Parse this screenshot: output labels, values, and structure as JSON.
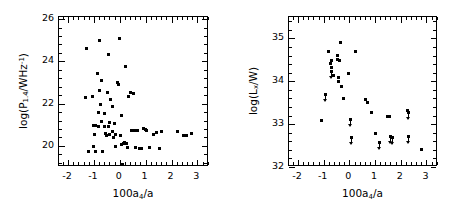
{
  "figure": {
    "background": "#ffffff",
    "marker_color": "#000000",
    "panel_count": 2
  },
  "chart_data": [
    {
      "type": "scatter",
      "panel": "left",
      "title": "",
      "xlabel": "100a4/a",
      "ylabel": "log(P1.4/WHz^-1)",
      "xlabel_parts": {
        "pre": "100a",
        "sub": "4",
        "post": "/a"
      },
      "ylabel_parts": {
        "pre": "log(P",
        "sub": "1.4",
        "mid": "/WHz",
        "sup": "-1",
        "post": ")"
      },
      "xlim": [
        -2.35,
        3.45
      ],
      "ylim": [
        19.0,
        26.1
      ],
      "xticks": [
        -2,
        -1,
        0,
        1,
        2,
        3
      ],
      "xticklabels": [
        "-2",
        "-1",
        "0",
        "1",
        "2",
        "3"
      ],
      "yticks": [
        20,
        22,
        24,
        26
      ],
      "yticklabels": [
        "20",
        "22",
        "24",
        "26"
      ],
      "xminor_step": 0.2,
      "yminor_step": 0.4,
      "grid": false,
      "legend": null,
      "points": [
        [
          -1.3,
          24.62
        ],
        [
          -1.32,
          22.3
        ],
        [
          -1.22,
          19.72
        ],
        [
          -1.05,
          22.32
        ],
        [
          -1.03,
          20.95
        ],
        [
          -1.02,
          19.97
        ],
        [
          -0.98,
          20.52
        ],
        [
          -0.95,
          20.98
        ],
        [
          -0.92,
          19.72
        ],
        [
          -0.88,
          23.42
        ],
        [
          -0.84,
          21.6
        ],
        [
          -0.82,
          20.92
        ],
        [
          -0.8,
          22.62
        ],
        [
          -0.78,
          25.0
        ],
        [
          -0.76,
          21.98
        ],
        [
          -0.72,
          23.08
        ],
        [
          -0.7,
          21.15
        ],
        [
          -0.66,
          19.73
        ],
        [
          -0.6,
          20.92
        ],
        [
          -0.58,
          21.52
        ],
        [
          -0.55,
          20.6
        ],
        [
          -0.52,
          20.48
        ],
        [
          -0.48,
          22.52
        ],
        [
          -0.45,
          24.32
        ],
        [
          -0.42,
          20.9
        ],
        [
          -0.4,
          21.12
        ],
        [
          -0.38,
          20.55
        ],
        [
          -0.35,
          22.2
        ],
        [
          -0.3,
          21.85
        ],
        [
          -0.28,
          20.7
        ],
        [
          -0.25,
          20.38
        ],
        [
          -0.22,
          21.08
        ],
        [
          -0.18,
          20.52
        ],
        [
          -0.15,
          19.98
        ],
        [
          -0.1,
          23.02
        ],
        [
          -0.05,
          22.9
        ],
        [
          0.0,
          25.1
        ],
        [
          0.02,
          20.48
        ],
        [
          0.05,
          20.08
        ],
        [
          0.08,
          21.42
        ],
        [
          0.12,
          19.1
        ],
        [
          0.15,
          20.12
        ],
        [
          0.18,
          20.18
        ],
        [
          0.22,
          23.78
        ],
        [
          0.25,
          20.12
        ],
        [
          0.3,
          19.92
        ],
        [
          0.35,
          22.32
        ],
        [
          0.4,
          22.52
        ],
        [
          0.45,
          20.72
        ],
        [
          0.52,
          22.48
        ],
        [
          0.58,
          20.72
        ],
        [
          0.62,
          19.9
        ],
        [
          0.7,
          20.72
        ],
        [
          0.78,
          19.88
        ],
        [
          0.85,
          19.88
        ],
        [
          0.92,
          20.82
        ],
        [
          1.0,
          20.78
        ],
        [
          1.05,
          20.72
        ],
        [
          1.15,
          19.9
        ],
        [
          1.3,
          20.52
        ],
        [
          1.42,
          20.62
        ],
        [
          1.52,
          19.88
        ],
        [
          1.55,
          19.88
        ],
        [
          1.6,
          20.7
        ],
        [
          2.22,
          20.68
        ],
        [
          2.45,
          20.48
        ],
        [
          2.58,
          20.5
        ],
        [
          2.78,
          20.58
        ]
      ]
    },
    {
      "type": "scatter",
      "panel": "right",
      "title": "",
      "xlabel": "100a4/a",
      "ylabel": "log(Lx/W)",
      "xlabel_parts": {
        "pre": "100a",
        "sub": "4",
        "post": "/a"
      },
      "ylabel_parts": {
        "pre": "log(L",
        "sub": "x",
        "post": "/W)"
      },
      "xlim": [
        -2.35,
        3.45
      ],
      "ylim": [
        32.0,
        35.5
      ],
      "xticks": [
        -2,
        -1,
        0,
        1,
        2,
        3
      ],
      "xticklabels": [
        "-2",
        "-1",
        "0",
        "1",
        "2",
        "3"
      ],
      "yticks": [
        32,
        33,
        34,
        35
      ],
      "yticklabels": [
        "32",
        "33",
        "34",
        "35"
      ],
      "xminor_step": 0.2,
      "yminor_step": 0.2,
      "grid": false,
      "legend": null,
      "points": [
        [
          -1.1,
          33.08
        ],
        [
          -0.92,
          33.7
        ],
        [
          -0.8,
          34.7
        ],
        [
          -0.72,
          34.42
        ],
        [
          -0.7,
          34.32
        ],
        [
          -0.7,
          34.48
        ],
        [
          -0.68,
          34.22
        ],
        [
          -0.62,
          34.14
        ],
        [
          -0.48,
          34.6
        ],
        [
          -0.46,
          34.5
        ],
        [
          -0.44,
          34.1
        ],
        [
          -0.42,
          34.0
        ],
        [
          -0.4,
          34.48
        ],
        [
          -0.38,
          34.49
        ],
        [
          -0.35,
          34.9
        ],
        [
          -0.3,
          33.88
        ],
        [
          -0.22,
          33.6
        ],
        [
          -0.05,
          34.18
        ],
        [
          0.05,
          33.1
        ],
        [
          0.1,
          32.7
        ],
        [
          0.25,
          34.7
        ],
        [
          0.62,
          33.58
        ],
        [
          0.7,
          33.5
        ],
        [
          0.85,
          33.28
        ],
        [
          1.02,
          32.78
        ],
        [
          1.18,
          32.58
        ],
        [
          1.48,
          33.18
        ],
        [
          1.55,
          33.18
        ],
        [
          1.62,
          32.72
        ],
        [
          1.68,
          32.68
        ],
        [
          2.28,
          33.32
        ],
        [
          2.3,
          33.28
        ],
        [
          2.32,
          32.72
        ],
        [
          2.8,
          32.4
        ]
      ],
      "upper_limits": [
        [
          -0.92,
          33.7
        ],
        [
          -0.68,
          34.22
        ],
        [
          0.05,
          33.1
        ],
        [
          0.1,
          32.7
        ],
        [
          1.18,
          32.58
        ],
        [
          1.62,
          32.72
        ],
        [
          1.68,
          32.68
        ],
        [
          2.32,
          32.72
        ],
        [
          2.3,
          33.28
        ]
      ]
    }
  ]
}
